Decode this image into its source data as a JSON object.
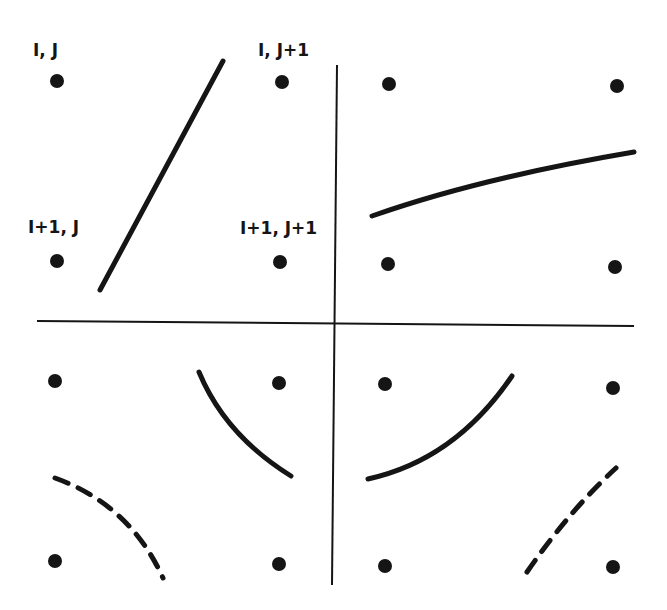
{
  "colors": {
    "background": "#ffffff",
    "ink": "#151515"
  },
  "labels": [
    {
      "text": "I, J",
      "x": 33,
      "y": 40
    },
    {
      "text": "I, J+1",
      "x": 258,
      "y": 40
    },
    {
      "text": "I+1, J",
      "x": 28,
      "y": 217
    },
    {
      "text": "I+1, J+1",
      "x": 240,
      "y": 218
    }
  ],
  "dividers": {
    "vertical": {
      "x1": 337,
      "y1": 65,
      "x2": 332,
      "y2": 585
    },
    "horizontal": {
      "x1": 37,
      "y1": 321,
      "x2": 634,
      "y2": 326
    }
  },
  "quadrants": [
    {
      "name": "top-left",
      "nodes": [
        [
          57,
          81
        ],
        [
          282,
          82
        ],
        [
          57,
          261
        ],
        [
          280,
          262
        ]
      ],
      "contours": [
        {
          "style": "solid",
          "path": "M100,290 L223,61"
        }
      ]
    },
    {
      "name": "top-right",
      "nodes": [
        [
          389,
          84
        ],
        [
          617,
          86
        ],
        [
          388,
          264
        ],
        [
          615,
          267
        ]
      ],
      "contours": [
        {
          "style": "solid",
          "path": "M372,216 Q480,178 634,152"
        }
      ]
    },
    {
      "name": "bottom-left",
      "nodes": [
        [
          55,
          381
        ],
        [
          279,
          383
        ],
        [
          55,
          561
        ],
        [
          279,
          564
        ]
      ],
      "contours": [
        {
          "style": "solid",
          "path": "M199,372 Q225,435 291,476"
        },
        {
          "style": "dashed",
          "path": "M55,478 Q130,505 163,578"
        }
      ]
    },
    {
      "name": "bottom-right",
      "nodes": [
        [
          385,
          384
        ],
        [
          613,
          388
        ],
        [
          385,
          566
        ],
        [
          613,
          567
        ]
      ],
      "contours": [
        {
          "style": "solid",
          "path": "M368,479 Q455,460 512,376"
        },
        {
          "style": "dashed",
          "path": "M527,572 Q570,510 616,468"
        }
      ]
    }
  ]
}
